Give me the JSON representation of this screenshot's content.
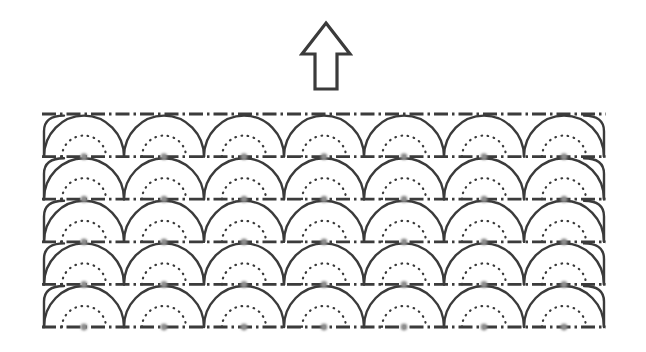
{
  "figure": {
    "kind": "technical-line-drawing",
    "background_color": "#ffffff",
    "width": 646,
    "height": 352,
    "ink_color": "#3a3a3a",
    "dot_color": "#8c8c8c"
  },
  "arrow": {
    "name": "up-arrow",
    "direction": "up",
    "style": "outline",
    "stroke_color": "#3a3a3a",
    "fill_color": "#ffffff",
    "stroke_width": 3.2,
    "tip_x": 326,
    "tip_y": 23,
    "head_half_width": 24,
    "head_base_y": 54,
    "shaft_half_width": 11,
    "shaft_bottom_y": 89
  },
  "pattern": {
    "name": "scalloped-arch-pattern",
    "rows": 5,
    "columns": 7,
    "left_x": 44,
    "top_y": 114,
    "cell_width": 80,
    "row_height": 42.6,
    "arch": {
      "stroke_color": "#3a3a3a",
      "stroke_width": 2.4,
      "rx": 40,
      "ry": 41
    },
    "inner_arc": {
      "stroke_color": "#3a3a3a",
      "stroke_width": 2.2,
      "dash": "0.6 5.6",
      "linecap": "round",
      "rx": 22,
      "ry": 21
    },
    "baseline": {
      "stroke_color": "#3a3a3a",
      "stroke_width": 2.8,
      "dash_pattern": "14 4 2.5 4",
      "count": 6
    },
    "center_dot": {
      "color": "#8c8c8c",
      "radius": 3.4,
      "blur": 1.1,
      "count_per_row": 7
    }
  }
}
